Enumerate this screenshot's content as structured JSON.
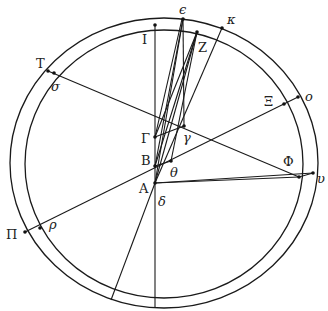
{
  "figure": {
    "type": "geometric construction",
    "circles": [
      {
        "name": "outer-circle",
        "cx": 164,
        "cy": 163,
        "rx": 154,
        "ry": 145
      },
      {
        "name": "inner-circle",
        "cx": 163,
        "cy": 163,
        "rx": 139,
        "ry": 136
      }
    ],
    "labels": {
      "I": "I",
      "epsilon": "ϵ",
      "Z": "Z",
      "kappa": "κ",
      "T": "T",
      "sigma": "σ",
      "Xi": "Ξ",
      "o": "o",
      "Gamma": "Γ",
      "gamma": "γ",
      "B": "B",
      "theta": "θ",
      "A": "A",
      "delta": "δ",
      "Phi": "Φ",
      "upsilon": "υ",
      "Pi": "Π",
      "rho": "ρ"
    },
    "points": {
      "I": [
        155,
        25
      ],
      "epsilon": [
        183,
        19
      ],
      "Z": [
        197,
        32
      ],
      "kappa": [
        222,
        28
      ],
      "T": [
        48,
        71
      ],
      "sigma": [
        54,
        73
      ],
      "Xi": [
        284,
        104
      ],
      "o": [
        298,
        97
      ],
      "Gamma": [
        155,
        137
      ],
      "gamma": [
        184,
        126
      ],
      "B": [
        155,
        166
      ],
      "theta": [
        171,
        161
      ],
      "A": [
        155,
        183
      ],
      "Phi": [
        299,
        177
      ],
      "upsilon": [
        313,
        173
      ],
      "Pi": [
        25,
        232
      ],
      "rho": [
        40,
        228
      ],
      "bottom_inner": [
        155,
        297
      ],
      "bottom_outer": [
        155,
        307
      ],
      "slant_bottom": [
        111,
        300
      ]
    }
  }
}
